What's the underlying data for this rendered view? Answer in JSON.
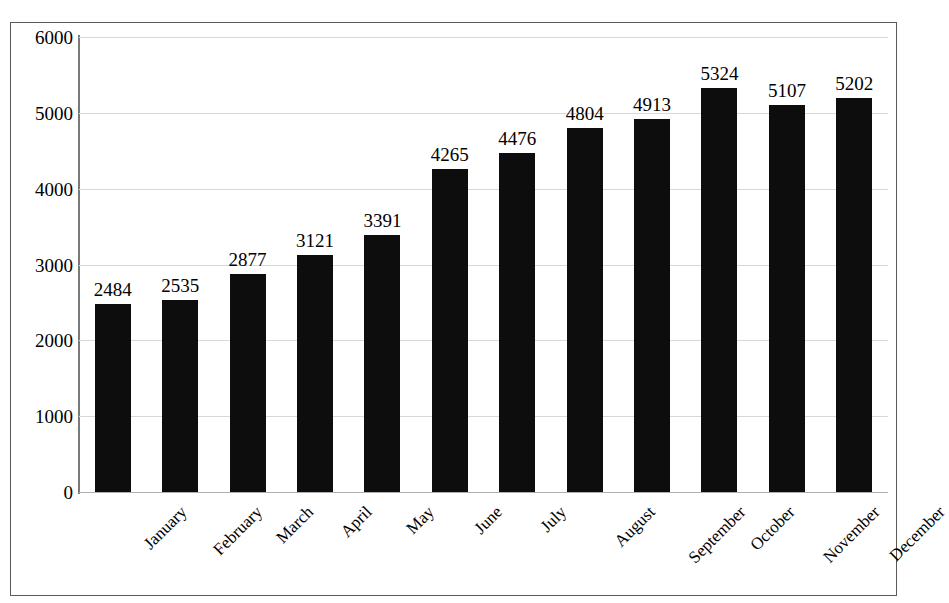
{
  "chart_data": {
    "type": "bar",
    "title": "",
    "title_visible_fragment": "",
    "xlabel": "",
    "ylabel": "",
    "categories": [
      "January",
      "February",
      "March",
      "April",
      "May",
      "June",
      "July",
      "August",
      "September",
      "October",
      "November",
      "December"
    ],
    "values": [
      2484,
      2535,
      2877,
      3121,
      3391,
      4265,
      4476,
      4804,
      4913,
      5324,
      5107,
      5202
    ],
    "data_labels": [
      "2484",
      "2535",
      "2877",
      "3121",
      "3391",
      "4265",
      "4476",
      "4804",
      "4913",
      "5324",
      "5107",
      "5202"
    ],
    "ylim": [
      0,
      6000
    ],
    "y_ticks": [
      0,
      1000,
      2000,
      3000,
      4000,
      5000,
      6000
    ],
    "y_tick_labels": [
      "0",
      "1000",
      "2000",
      "3000",
      "4000",
      "5000",
      "6000"
    ],
    "grid": true,
    "grid_axis": "y",
    "legend": false,
    "legend_position": "none",
    "bar_color": "#0d0d0d",
    "gridline_color": "#d8d8d8",
    "axis_color": "#7a7a7a",
    "frame_color": "#5a5a5a",
    "background_color": "#ffffff",
    "x_tick_rotation": -45
  }
}
